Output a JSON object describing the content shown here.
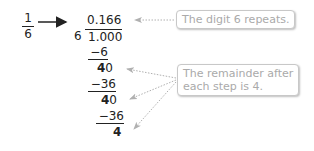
{
  "fraction": {
    "numerator": "1",
    "denominator": "6"
  },
  "division": {
    "quotient": "0.166",
    "divisor": "6",
    "dividend": "1.000",
    "steps": [
      {
        "subtract": "−6",
        "remainder_bold": "4",
        "remainder_rest": "0"
      },
      {
        "subtract": "−36",
        "remainder_bold": "4",
        "remainder_rest": "0"
      },
      {
        "subtract": "−36",
        "remainder_bold": "4",
        "remainder_rest": ""
      }
    ]
  },
  "callouts": {
    "repeat": "The digit 6 repeats.",
    "remainder_line1": "The remainder after",
    "remainder_line2": "each step is 4."
  },
  "colors": {
    "text": "#222222",
    "callout_text": "#aaaaaa",
    "arrow_dotted": "#b0b0b0"
  }
}
